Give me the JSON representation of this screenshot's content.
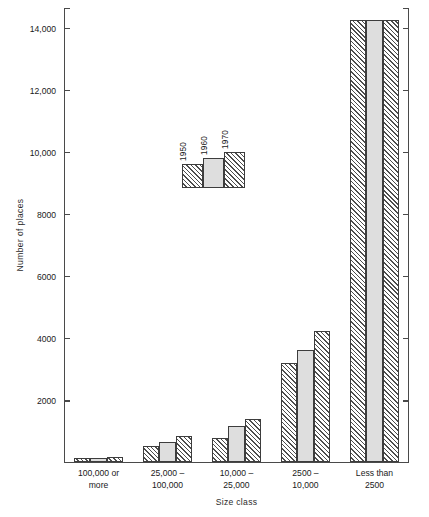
{
  "chart_data": {
    "type": "bar",
    "title": "",
    "xlabel": "Size class",
    "ylabel": "Number of places",
    "categories": [
      "100,000 or more",
      "25,000 – 100,000",
      "10,000 – 25,000",
      "2500 – 10,000",
      "Less than 2500"
    ],
    "category_lines": [
      {
        "line1": "100,000  or",
        "line2": "more"
      },
      {
        "line1": "25,000  –",
        "line2": "100,000"
      },
      {
        "line1": "10,000  –",
        "line2": "25,000"
      },
      {
        "line1": "2500  –",
        "line2": "10,000"
      },
      {
        "line1": "Less  than",
        "line2": "2500"
      }
    ],
    "series": [
      {
        "name": "1950",
        "pattern": "diagonal-hatch",
        "values": [
          110,
          500,
          780,
          3180,
          14250
        ]
      },
      {
        "name": "1960",
        "pattern": "solid-gray",
        "values": [
          130,
          620,
          1150,
          3610,
          14250
        ]
      },
      {
        "name": "1970",
        "pattern": "cross-hatch",
        "values": [
          150,
          830,
          1380,
          4220,
          14250
        ]
      }
    ],
    "ylim": [
      0,
      14600
    ],
    "yticks": [
      0,
      2000,
      4000,
      6000,
      8000,
      10000,
      12000,
      14000
    ],
    "ytick_labels": [
      "",
      "2000",
      "4000",
      "6000",
      "8000",
      "10,000",
      "12,000",
      "14,000"
    ],
    "grid": false,
    "legend_position": "inside-upper-left",
    "legend_entries": [
      "1950",
      "1960",
      "1970"
    ],
    "colors": {
      "axis": "#4a4a4a",
      "bar_outline": "#3d3d3d",
      "hatch": "#4d4d4d",
      "solid_fill": "#dedede",
      "background": "#ffffff",
      "text": "#1a1a1a"
    }
  }
}
